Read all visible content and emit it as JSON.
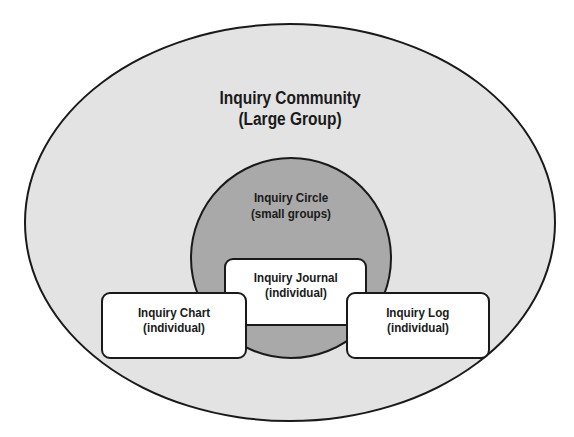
{
  "diagram": {
    "type": "nested-venn",
    "community": {
      "line1": "Inquiry Community",
      "line2": "(Large Group)"
    },
    "circle": {
      "line1": "Inquiry Circle",
      "line2": "(small groups)"
    },
    "boxes": [
      {
        "id": "journal",
        "line1": "Inquiry Journal",
        "line2": "(individual)"
      },
      {
        "id": "chart",
        "line1": "Inquiry Chart",
        "line2": "(individual)"
      },
      {
        "id": "log",
        "line1": "Inquiry Log",
        "line2": "(individual)"
      }
    ],
    "colors": {
      "community_fill": "#e3e3e3",
      "circle_fill": "#a9a9a9",
      "box_fill": "#ffffff",
      "stroke": "#1a1a1a"
    }
  }
}
